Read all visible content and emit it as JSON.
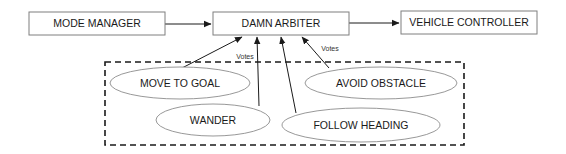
{
  "diagram": {
    "nodes": [
      {
        "id": "mode_manager",
        "label": "MODE MANAGER",
        "shape": "rect",
        "x": 29,
        "y": 12,
        "w": 136,
        "h": 23
      },
      {
        "id": "damn_arbiter",
        "label": "DAMN ARBITER",
        "shape": "rect",
        "x": 213,
        "y": 12,
        "w": 136,
        "h": 23
      },
      {
        "id": "vehicle_controller",
        "label": "VEHICLE CONTROLLER",
        "shape": "rect",
        "x": 401,
        "y": 11,
        "w": 136,
        "h": 23
      },
      {
        "id": "move_to_goal",
        "label": "MOVE TO GOAL",
        "shape": "ellipse",
        "cx": 180,
        "cy": 83,
        "rx": 70,
        "ry": 16
      },
      {
        "id": "wander",
        "label": "WANDER",
        "shape": "ellipse",
        "cx": 213,
        "cy": 120,
        "rx": 57,
        "ry": 16
      },
      {
        "id": "avoid_obstacle",
        "label": "AVOID OBSTACLE",
        "shape": "ellipse",
        "cx": 381,
        "cy": 83,
        "rx": 76,
        "ry": 16
      },
      {
        "id": "follow_heading",
        "label": "FOLLOW HEADING",
        "shape": "ellipse",
        "cx": 361,
        "cy": 125,
        "rx": 79,
        "ry": 17
      }
    ],
    "group": {
      "id": "behaviors",
      "style": "dashed",
      "x": 105,
      "y": 62,
      "w": 359,
      "h": 83
    },
    "edges": [
      {
        "from": "mode_manager",
        "to": "damn_arbiter",
        "x1": 165,
        "y1": 24,
        "x2": 211,
        "y2": 24
      },
      {
        "from": "damn_arbiter",
        "to": "vehicle_controller",
        "x1": 349,
        "y1": 23,
        "x2": 399,
        "y2": 23
      },
      {
        "from": "move_to_goal",
        "to": "damn_arbiter",
        "x1": 182,
        "y1": 68,
        "x2": 242,
        "y2": 37
      },
      {
        "from": "wander",
        "to": "damn_arbiter",
        "x1": 259,
        "y1": 106,
        "x2": 257,
        "y2": 37
      },
      {
        "from": "follow_heading",
        "to": "damn_arbiter",
        "x1": 296,
        "y1": 113,
        "x2": 281,
        "y2": 37
      },
      {
        "from": "avoid_obstacle",
        "to": "damn_arbiter",
        "x1": 329,
        "y1": 68,
        "x2": 302,
        "y2": 37
      }
    ],
    "edge_labels": [
      {
        "text": "Votes",
        "x": 245,
        "y": 57
      },
      {
        "text": "Votes",
        "x": 330,
        "y": 49
      }
    ]
  },
  "colors": {
    "box_stroke": "#7f7f7f",
    "ellipse_stroke": "#8c8c8c",
    "line": "#1a1a1a",
    "text": "#1a1a1a"
  }
}
